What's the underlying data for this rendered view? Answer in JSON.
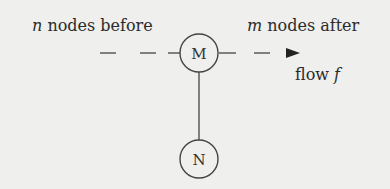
{
  "diagram": {
    "labels": {
      "before_var": "n",
      "before_text": " nodes before",
      "after_var": "m",
      "after_text": " nodes after",
      "flow_text": "flow ",
      "flow_var": "f"
    },
    "nodes": [
      {
        "id": "M",
        "label": "M"
      },
      {
        "id": "N",
        "label": "N"
      }
    ],
    "edges": [
      {
        "from": "before",
        "to": "M",
        "style": "dashed"
      },
      {
        "from": "M",
        "to": "after",
        "style": "dashed-arrow"
      },
      {
        "from": "M",
        "to": "N",
        "style": "solid"
      }
    ],
    "colors": {
      "background": "#efefed",
      "stroke": "#444444",
      "text": "#2b2b2b"
    }
  }
}
